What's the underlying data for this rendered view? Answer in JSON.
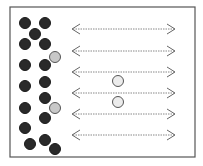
{
  "diagram": {
    "frame": {
      "x": 10,
      "y": 7,
      "width": 185,
      "height": 150,
      "stroke": "#555555"
    },
    "colors": {
      "dark": "#2a2a2a",
      "gray": "#c8c8c8",
      "light": "#ececec",
      "arrow": "#888888"
    },
    "dark_particles": [
      [
        25,
        23
      ],
      [
        45,
        23
      ],
      [
        35,
        34
      ],
      [
        25,
        44
      ],
      [
        45,
        44
      ],
      [
        25,
        65
      ],
      [
        45,
        65
      ],
      [
        45,
        82
      ],
      [
        25,
        86
      ],
      [
        45,
        98
      ],
      [
        25,
        108
      ],
      [
        45,
        118
      ],
      [
        25,
        128
      ],
      [
        30,
        144
      ],
      [
        45,
        140
      ],
      [
        55,
        149
      ]
    ],
    "gray_particles": [
      [
        55,
        57
      ],
      [
        55,
        108
      ]
    ],
    "light_particles": [
      [
        118,
        81
      ],
      [
        118,
        102
      ]
    ],
    "arrows": {
      "x1": 72,
      "x2": 175,
      "y": [
        29,
        51,
        72,
        93,
        114,
        135
      ]
    }
  }
}
